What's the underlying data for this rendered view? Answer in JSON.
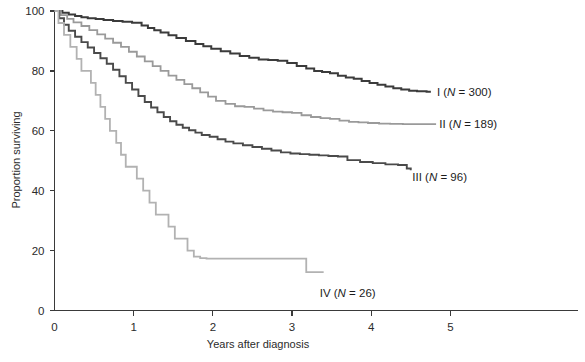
{
  "chart_data": {
    "type": "line",
    "title": "",
    "subtitle": "",
    "xlabel": "Years after diagnosis",
    "ylabel": "Proportion surviving",
    "xlim": [
      0,
      5.4
    ],
    "ylim": [
      0,
      100
    ],
    "xticks": [
      0,
      1,
      2,
      3,
      4,
      5
    ],
    "xtick_labels": [
      "0",
      "1",
      "2",
      "3",
      "4",
      "5"
    ],
    "yticks": [
      0,
      20,
      40,
      60,
      80,
      100
    ],
    "ytick_labels": [
      "0",
      "20",
      "40",
      "60",
      "80",
      "100"
    ],
    "grid": false,
    "legend_position": "inline-right-of-curve-end",
    "step_style": "post",
    "series": [
      {
        "name": "I",
        "label_text": "I (N = 300)",
        "label_prefix": "I (",
        "label_italic": "N",
        "label_suffix": " = 300)",
        "n": 300,
        "color": "#3b3b3b",
        "stroke_width": 2.0,
        "label_x": 4.83,
        "label_y": 73.0,
        "x": [
          0.0,
          0.1,
          0.18,
          0.26,
          0.34,
          0.42,
          0.52,
          0.62,
          0.74,
          0.86,
          0.98,
          1.1,
          1.18,
          1.26,
          1.34,
          1.44,
          1.54,
          1.66,
          1.78,
          1.88,
          1.98,
          2.1,
          2.22,
          2.34,
          2.46,
          2.58,
          2.7,
          2.82,
          2.94,
          3.06,
          3.18,
          3.28,
          3.38,
          3.48,
          3.58,
          3.68,
          3.78,
          3.88,
          3.98,
          4.08,
          4.18,
          4.28,
          4.38,
          4.48,
          4.58,
          4.7
        ],
        "y": [
          100.0,
          99.4,
          98.8,
          98.3,
          97.9,
          97.6,
          97.3,
          97.0,
          96.7,
          96.4,
          96.1,
          95.2,
          94.3,
          93.6,
          92.8,
          91.9,
          91.0,
          90.0,
          89.0,
          88.2,
          87.4,
          86.6,
          85.8,
          85.0,
          84.4,
          83.8,
          83.6,
          83.4,
          82.6,
          81.6,
          80.8,
          80.0,
          79.6,
          79.2,
          78.4,
          77.8,
          77.4,
          76.6,
          76.0,
          75.4,
          74.8,
          74.2,
          73.8,
          73.4,
          73.2,
          73.0
        ]
      },
      {
        "name": "II",
        "label_text": "II (N = 189)",
        "label_prefix": "II (",
        "label_italic": "N",
        "label_suffix": " = 189)",
        "n": 189,
        "color": "#9a9a9a",
        "stroke_width": 1.8,
        "label_x": 4.86,
        "label_y": 62.2,
        "x": [
          0.0,
          0.08,
          0.16,
          0.24,
          0.34,
          0.44,
          0.54,
          0.64,
          0.74,
          0.84,
          0.94,
          1.04,
          1.14,
          1.24,
          1.34,
          1.44,
          1.54,
          1.64,
          1.74,
          1.84,
          1.94,
          2.04,
          2.16,
          2.28,
          2.4,
          2.52,
          2.64,
          2.76,
          2.88,
          3.0,
          3.12,
          3.24,
          3.36,
          3.48,
          3.6,
          3.72,
          3.84,
          3.96,
          4.1,
          4.24,
          4.4,
          4.55,
          4.7,
          4.82
        ],
        "y": [
          100.0,
          98.6,
          97.4,
          96.2,
          95.0,
          93.6,
          92.2,
          90.8,
          89.4,
          88.0,
          86.4,
          84.8,
          83.2,
          81.6,
          80.0,
          78.4,
          77.0,
          75.6,
          74.2,
          72.8,
          71.4,
          70.0,
          69.0,
          68.2,
          68.0,
          67.4,
          66.8,
          66.4,
          66.2,
          66.0,
          65.2,
          64.6,
          64.2,
          64.0,
          63.4,
          63.0,
          62.8,
          62.6,
          62.4,
          62.3,
          62.2,
          62.2,
          62.2,
          62.2
        ]
      },
      {
        "name": "III",
        "label_text": "III (N = 96)",
        "label_prefix": "III (",
        "label_italic": "N",
        "label_suffix": " = 96)",
        "n": 96,
        "color": "#4a4a4a",
        "stroke_width": 1.9,
        "label_x": 4.52,
        "label_y": 44.5,
        "x": [
          0.0,
          0.06,
          0.12,
          0.18,
          0.26,
          0.34,
          0.42,
          0.5,
          0.58,
          0.66,
          0.74,
          0.82,
          0.9,
          0.98,
          1.06,
          1.14,
          1.22,
          1.3,
          1.38,
          1.46,
          1.54,
          1.62,
          1.7,
          1.78,
          1.86,
          1.96,
          2.06,
          2.16,
          2.26,
          2.38,
          2.5,
          2.62,
          2.74,
          2.86,
          2.98,
          3.1,
          3.22,
          3.34,
          3.46,
          3.58,
          3.7,
          3.86,
          4.02,
          4.18,
          4.34,
          4.45,
          4.5
        ],
        "y": [
          100.0,
          97.6,
          95.4,
          93.4,
          91.4,
          89.6,
          87.8,
          86.0,
          84.2,
          82.4,
          80.4,
          78.2,
          76.0,
          73.8,
          71.6,
          69.6,
          67.8,
          66.2,
          64.6,
          63.2,
          62.0,
          61.0,
          60.2,
          59.4,
          58.6,
          58.0,
          57.2,
          56.4,
          55.8,
          55.2,
          54.6,
          54.0,
          53.4,
          52.8,
          52.4,
          52.2,
          52.0,
          51.8,
          51.6,
          51.4,
          50.2,
          49.6,
          49.2,
          48.8,
          48.6,
          47.4,
          46.8
        ]
      },
      {
        "name": "IV",
        "label_text": "IV (N = 26)",
        "label_prefix": "IV (",
        "label_italic": "N",
        "label_suffix": " = 26)",
        "n": 26,
        "color": "#b2b2b2",
        "stroke_width": 1.8,
        "label_x": 3.35,
        "label_y": 6.0,
        "x": [
          0.0,
          0.05,
          0.12,
          0.2,
          0.28,
          0.34,
          0.4,
          0.46,
          0.52,
          0.58,
          0.64,
          0.7,
          0.78,
          0.84,
          0.9,
          0.96,
          1.04,
          1.12,
          1.2,
          1.28,
          1.36,
          1.44,
          1.52,
          1.6,
          1.68,
          1.76,
          1.84,
          1.92,
          2.3,
          3.1,
          3.18,
          3.4
        ],
        "y": [
          100.0,
          96.0,
          92.0,
          88.0,
          84.0,
          80.0,
          80.0,
          76.0,
          72.0,
          68.0,
          64.0,
          60.0,
          56.0,
          52.0,
          48.0,
          48.0,
          44.0,
          40.0,
          36.0,
          32.0,
          32.0,
          28.0,
          24.0,
          24.0,
          20.0,
          18.0,
          17.5,
          17.3,
          17.3,
          17.3,
          12.8,
          12.8
        ]
      }
    ]
  }
}
